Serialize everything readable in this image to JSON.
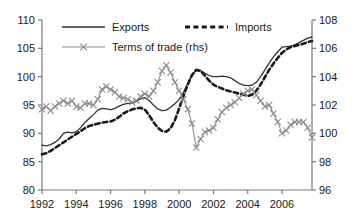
{
  "chart_data": {
    "type": "line",
    "title": "",
    "xlabel": "",
    "ylabel": "",
    "grid": false,
    "legend_position": "top-inside",
    "x_tick_labels": [
      "1992",
      "1994",
      "1996",
      "1998",
      "2000",
      "2002",
      "2004",
      "2006"
    ],
    "x_tick_values": [
      1992,
      1994,
      1996,
      1998,
      2000,
      2002,
      2004,
      2006
    ],
    "xlim": [
      1992,
      2007.75
    ],
    "left_axis": {
      "ylim": [
        80,
        110
      ],
      "tick_labels": [
        "80",
        "85",
        "90",
        "95",
        "100",
        "105",
        "110"
      ],
      "tick_values": [
        80,
        85,
        90,
        95,
        100,
        105,
        110
      ]
    },
    "right_axis": {
      "ylim": [
        96,
        108
      ],
      "tick_labels": [
        "96",
        "98",
        "100",
        "102",
        "104",
        "106",
        "108"
      ],
      "tick_values": [
        96,
        98,
        100,
        102,
        104,
        106,
        108
      ]
    },
    "series": [
      {
        "name": "Exports",
        "axis": "left",
        "style": "solid",
        "color": "#333333",
        "marker": "none",
        "x": [
          1992.0,
          1992.25,
          1992.5,
          1992.75,
          1993.0,
          1993.25,
          1993.5,
          1993.75,
          1994.0,
          1994.25,
          1994.5,
          1994.75,
          1995.0,
          1995.25,
          1995.5,
          1995.75,
          1996.0,
          1996.25,
          1996.5,
          1996.75,
          1997.0,
          1997.25,
          1997.5,
          1997.75,
          1998.0,
          1998.25,
          1998.5,
          1998.75,
          1999.0,
          1999.25,
          1999.5,
          1999.75,
          2000.0,
          2000.25,
          2000.5,
          2000.75,
          2001.0,
          2001.25,
          2001.5,
          2001.75,
          2002.0,
          2002.25,
          2002.5,
          2002.75,
          2003.0,
          2003.25,
          2003.5,
          2003.75,
          2004.0,
          2004.25,
          2004.5,
          2004.75,
          2005.0,
          2005.25,
          2005.5,
          2005.75,
          2006.0,
          2006.25,
          2006.5,
          2006.75,
          2007.0,
          2007.25,
          2007.5,
          2007.75
        ],
        "values": [
          87.9,
          87.8,
          88.0,
          88.4,
          89.0,
          90.0,
          90.2,
          90.1,
          90.3,
          91.0,
          91.9,
          92.6,
          93.3,
          94.1,
          94.4,
          94.3,
          94.2,
          94.4,
          94.8,
          95.1,
          95.3,
          95.3,
          95.6,
          96.1,
          96.3,
          95.8,
          95.0,
          94.3,
          94.0,
          94.1,
          94.6,
          95.2,
          96.0,
          97.2,
          98.8,
          100.3,
          101.2,
          101.1,
          100.6,
          100.2,
          100.0,
          100.0,
          100.1,
          100.0,
          99.8,
          99.3,
          98.8,
          98.5,
          98.4,
          98.5,
          99.0,
          100.0,
          101.2,
          102.4,
          103.5,
          104.4,
          105.2,
          105.3,
          105.4,
          105.6,
          106.0,
          106.4,
          106.8,
          107.0
        ]
      },
      {
        "name": "Imports",
        "axis": "left",
        "style": "dashed",
        "color": "#1a1a1a",
        "marker": "none",
        "x": [
          1992.0,
          1992.25,
          1992.5,
          1992.75,
          1993.0,
          1993.25,
          1993.5,
          1993.75,
          1994.0,
          1994.25,
          1994.5,
          1994.75,
          1995.0,
          1995.25,
          1995.5,
          1995.75,
          1996.0,
          1996.25,
          1996.5,
          1996.75,
          1997.0,
          1997.25,
          1997.5,
          1997.75,
          1998.0,
          1998.25,
          1998.5,
          1998.75,
          1999.0,
          1999.25,
          1999.5,
          1999.75,
          2000.0,
          2000.25,
          2000.5,
          2000.75,
          2001.0,
          2001.25,
          2001.5,
          2001.75,
          2002.0,
          2002.25,
          2002.5,
          2002.75,
          2003.0,
          2003.25,
          2003.5,
          2003.75,
          2004.0,
          2004.25,
          2004.5,
          2004.75,
          2005.0,
          2005.25,
          2005.5,
          2005.75,
          2006.0,
          2006.25,
          2006.5,
          2006.75,
          2007.0,
          2007.25,
          2007.5,
          2007.75
        ],
        "values": [
          86.3,
          86.5,
          86.9,
          87.4,
          87.9,
          88.4,
          88.9,
          89.4,
          89.9,
          90.4,
          90.9,
          91.3,
          91.5,
          91.7,
          91.9,
          92.0,
          92.1,
          92.4,
          92.9,
          93.5,
          93.9,
          94.2,
          94.4,
          94.5,
          94.2,
          93.2,
          92.0,
          91.0,
          90.4,
          90.3,
          90.9,
          92.3,
          94.4,
          96.6,
          98.6,
          100.3,
          101.2,
          101.0,
          100.2,
          99.3,
          98.6,
          98.2,
          97.9,
          97.6,
          97.4,
          97.2,
          97.0,
          96.8,
          96.6,
          96.8,
          97.5,
          98.6,
          99.9,
          101.2,
          102.3,
          103.3,
          104.2,
          104.8,
          105.2,
          105.4,
          105.6,
          105.8,
          106.1,
          106.3
        ]
      },
      {
        "name": "Terms of trade (rhs)",
        "axis": "right",
        "style": "solid",
        "color": "#8c8c8c",
        "marker": "x",
        "x": [
          1992.0,
          1992.25,
          1992.5,
          1992.75,
          1993.0,
          1993.25,
          1993.5,
          1993.75,
          1994.0,
          1994.25,
          1994.5,
          1994.75,
          1995.0,
          1995.25,
          1995.5,
          1995.75,
          1996.0,
          1996.25,
          1996.5,
          1996.75,
          1997.0,
          1997.25,
          1997.5,
          1997.75,
          1998.0,
          1998.25,
          1998.5,
          1998.75,
          1999.0,
          1999.25,
          1999.5,
          1999.75,
          2000.0,
          2000.25,
          2000.5,
          2000.75,
          2001.0,
          2001.25,
          2001.5,
          2001.75,
          2002.0,
          2002.25,
          2002.5,
          2002.75,
          2003.0,
          2003.25,
          2003.5,
          2003.75,
          2004.0,
          2004.25,
          2004.5,
          2004.75,
          2005.0,
          2005.25,
          2005.5,
          2005.75,
          2006.0,
          2006.25,
          2006.5,
          2006.75,
          2007.0,
          2007.25,
          2007.5,
          2007.75
        ],
        "values": [
          101.7,
          101.9,
          101.6,
          101.9,
          102.1,
          102.3,
          102.1,
          102.3,
          101.9,
          101.8,
          102.1,
          102.1,
          102.0,
          102.4,
          103.1,
          103.3,
          103.1,
          102.9,
          102.6,
          102.5,
          102.4,
          102.2,
          102.3,
          102.6,
          102.8,
          102.6,
          103.0,
          103.6,
          104.4,
          104.8,
          104.3,
          103.6,
          103.0,
          102.4,
          101.7,
          100.7,
          99.0,
          99.6,
          100.1,
          100.2,
          100.4,
          101.0,
          101.5,
          101.8,
          102.0,
          102.2,
          102.5,
          102.8,
          103.0,
          103.1,
          102.7,
          102.3,
          101.9,
          102.0,
          101.4,
          100.8,
          100.0,
          100.2,
          100.6,
          100.8,
          100.8,
          100.8,
          100.4,
          99.7
        ]
      }
    ]
  },
  "legend": {
    "items": [
      {
        "label": "Exports"
      },
      {
        "label": "Imports"
      },
      {
        "label": "Terms of trade (rhs)"
      }
    ]
  }
}
